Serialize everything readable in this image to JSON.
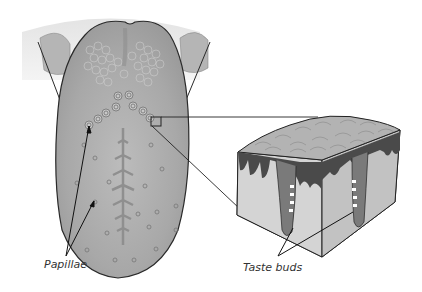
{
  "diagram": {
    "labels": {
      "papillae": "Papillae",
      "taste_buds": "Taste buds"
    },
    "colors": {
      "tongue_fill": "#a9a9a9",
      "tongue_light": "#c6c6c6",
      "outline": "#2a2a2a",
      "block_top": "#b4b4b4",
      "block_side_light": "#d2d2d2",
      "block_side_dark": "#bcbcbc",
      "epithelium_dark": "#4a4a4a"
    }
  }
}
